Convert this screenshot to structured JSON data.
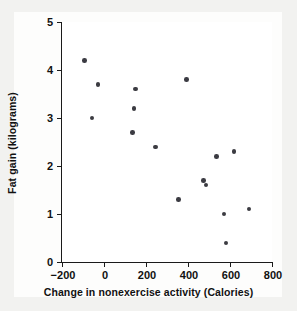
{
  "chart_data": {
    "type": "scatter",
    "title": "",
    "xlabel": "Change in nonexercise activity (Calories)",
    "ylabel": "Fat gain (kilograms)",
    "xlim": [
      -200,
      800
    ],
    "ylim": [
      0,
      5
    ],
    "xticks": [
      -200,
      0,
      200,
      400,
      600,
      800
    ],
    "xtick_labels": [
      "−200",
      "0",
      "200",
      "400",
      "600",
      "800"
    ],
    "yticks": [
      0,
      1,
      2,
      3,
      4,
      5
    ],
    "ytick_labels": [
      "0",
      "1",
      "2",
      "3",
      "4",
      "5"
    ],
    "grid": false,
    "legend": null,
    "marker": {
      "shape": "circle",
      "color": "#3b3b42",
      "size_px": 4.6
    },
    "axis_color": "#1a1a1a",
    "plot_background": "#ffffff",
    "figure_background": "#f2f2f0",
    "n_points": 16,
    "x": [
      -94,
      -57,
      -29,
      135,
      143,
      151,
      245,
      355,
      392,
      473,
      486,
      535,
      571,
      580,
      620,
      690
    ],
    "y": [
      4.2,
      3.0,
      3.7,
      2.7,
      3.2,
      3.6,
      2.4,
      1.3,
      3.8,
      1.7,
      1.6,
      2.2,
      1.0,
      0.4,
      2.3,
      1.1
    ],
    "points": [
      {
        "x": -94,
        "y": 4.2
      },
      {
        "x": -57,
        "y": 3.0
      },
      {
        "x": -29,
        "y": 3.7
      },
      {
        "x": 135,
        "y": 2.7
      },
      {
        "x": 143,
        "y": 3.2
      },
      {
        "x": 151,
        "y": 3.6
      },
      {
        "x": 245,
        "y": 2.4
      },
      {
        "x": 355,
        "y": 1.3
      },
      {
        "x": 392,
        "y": 3.8
      },
      {
        "x": 473,
        "y": 1.7
      },
      {
        "x": 486,
        "y": 1.6
      },
      {
        "x": 535,
        "y": 2.2
      },
      {
        "x": 571,
        "y": 1.0
      },
      {
        "x": 580,
        "y": 0.4
      },
      {
        "x": 620,
        "y": 2.3
      },
      {
        "x": 690,
        "y": 1.1
      }
    ]
  }
}
